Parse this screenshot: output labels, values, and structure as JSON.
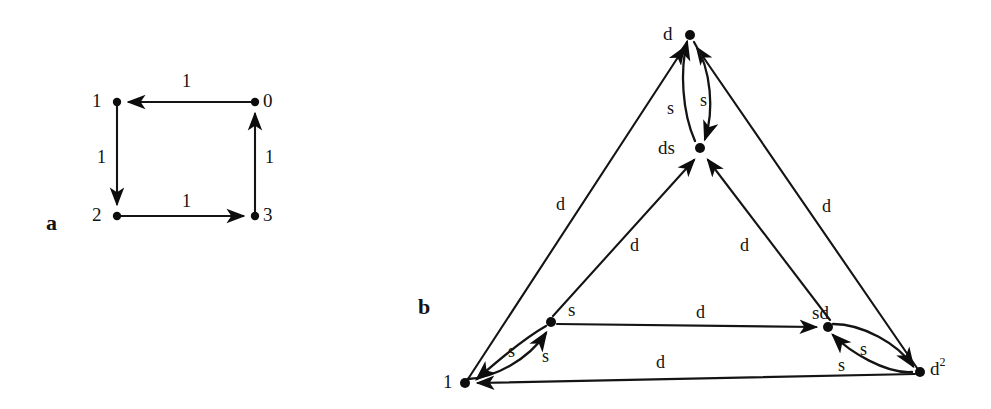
{
  "figure": {
    "width": 991,
    "height": 409,
    "background": "#ffffff",
    "ink_color": "#131313"
  },
  "panels": [
    {
      "id": "a",
      "label": "a",
      "x": 46,
      "y": 212
    },
    {
      "id": "b",
      "label": "b",
      "x": 418,
      "y": 296
    }
  ],
  "panel_a": {
    "label": "a",
    "description": "4-cycle directed graph on vertices 0,1,2,3 with all edge weights 1",
    "nodes": [
      {
        "id": "n1",
        "label": "1",
        "cx": 117,
        "cy": 102,
        "label_x": 92,
        "label_y": 91
      },
      {
        "id": "n0",
        "label": "0",
        "cx": 255,
        "cy": 102,
        "label_x": 263,
        "label_y": 91
      },
      {
        "id": "n2",
        "label": "2",
        "cx": 117,
        "cy": 216,
        "label_x": 92,
        "label_y": 205
      },
      {
        "id": "n3",
        "label": "3",
        "cx": 255,
        "cy": 216,
        "label_x": 263,
        "label_y": 205
      }
    ],
    "edges": [
      {
        "from": "n0",
        "to": "n1",
        "label": "1",
        "label_x": 182,
        "label_y": 72
      },
      {
        "from": "n1",
        "to": "n2",
        "label": "1",
        "label_x": 97,
        "label_y": 148
      },
      {
        "from": "n2",
        "to": "n3",
        "label": "1",
        "label_x": 182,
        "label_y": 192
      },
      {
        "from": "n3",
        "to": "n0",
        "label": "1",
        "label_x": 265,
        "label_y": 148
      }
    ]
  },
  "panel_b": {
    "label": "b",
    "description": "Directed graph with vertices 1, s, d, ds, sd, d^2 and edges labeled s and d",
    "nodes": [
      {
        "id": "v_d",
        "label": "d",
        "cx": 690,
        "cy": 35,
        "label_x": 663,
        "label_y": 24
      },
      {
        "id": "v_ds",
        "label": "ds",
        "cx": 700,
        "cy": 148,
        "label_x": 658,
        "label_y": 138
      },
      {
        "id": "v_s",
        "label": "s",
        "cx": 551,
        "cy": 322,
        "label_x": 568,
        "label_y": 300
      },
      {
        "id": "v_sd",
        "label": "sd",
        "cx": 828,
        "cy": 327,
        "label_x": 812,
        "label_y": 303
      },
      {
        "id": "v_1",
        "label": "1",
        "cx": 465,
        "cy": 383,
        "label_x": 443,
        "label_y": 372
      },
      {
        "id": "v_d2",
        "label": "d",
        "label_sup": "2",
        "cx": 920,
        "cy": 372,
        "label_x": 930,
        "label_y": 358
      }
    ],
    "edges": [
      {
        "from": "v_1",
        "to": "v_d",
        "label": "d",
        "label_x": 556,
        "label_y": 195
      },
      {
        "from": "v_d2",
        "to": "v_d",
        "label": "d",
        "label_x": 822,
        "label_y": 197
      },
      {
        "from": "v_1",
        "to": "v_ds",
        "label": "d",
        "label_x": 630,
        "label_y": 236
      },
      {
        "from": "v_d2",
        "to": "v_ds",
        "label": "d",
        "label_x": 740,
        "label_y": 236
      },
      {
        "from": "v_d",
        "to": "v_ds",
        "label": "s",
        "label_x": 700,
        "label_y": 91
      },
      {
        "from": "v_ds",
        "to": "v_d",
        "label": "s",
        "label_x": 667,
        "label_y": 99
      },
      {
        "from": "v_s",
        "to": "v_sd",
        "label": "d",
        "label_x": 696,
        "label_y": 303
      },
      {
        "from": "v_d2",
        "to": "v_1",
        "label": "d",
        "label_x": 656,
        "label_y": 353
      },
      {
        "from": "v_1",
        "to": "v_s",
        "label": "s",
        "label_x": 542,
        "label_y": 347
      },
      {
        "from": "v_s",
        "to": "v_1",
        "label": "s",
        "label_x": 508,
        "label_y": 342
      },
      {
        "from": "v_sd",
        "to": "v_d2",
        "label": "s",
        "label_x": 860,
        "label_y": 340
      },
      {
        "from": "v_d2",
        "to": "v_sd",
        "label": "s",
        "label_x": 838,
        "label_y": 356
      }
    ]
  }
}
